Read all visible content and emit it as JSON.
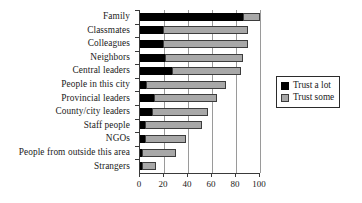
{
  "chart_data": {
    "type": "bar",
    "orientation": "horizontal",
    "stacked": true,
    "title": "",
    "xlabel": "",
    "ylabel": "",
    "xlim": [
      0,
      100
    ],
    "xticks": [
      0,
      20,
      40,
      60,
      80,
      100
    ],
    "grid": true,
    "grid_axis": "x",
    "legend_position": "right",
    "categories": [
      "Family",
      "Classmates",
      "Colleagues",
      "Neighbors",
      "Central leaders",
      "People in this city",
      "Provincial leaders",
      "County/city leaders",
      "Staff people",
      "NGOs",
      "People from outside this area",
      "Strangers"
    ],
    "series": [
      {
        "name": "Trust a lot",
        "color": "#000000",
        "values": [
          86,
          19,
          19,
          21,
          27,
          5,
          12,
          10,
          4,
          4,
          2,
          1
        ]
      },
      {
        "name": "Trust some",
        "color": "#a8a8a8",
        "values": [
          14,
          71,
          71,
          65,
          57,
          67,
          52,
          47,
          48,
          34,
          28,
          12
        ]
      }
    ],
    "totals": [
      100,
      90,
      90,
      86,
      84,
      72,
      64,
      57,
      52,
      38,
      30,
      13
    ]
  },
  "legend": {
    "items": [
      {
        "label": "Trust a lot",
        "swatch": "black-square-swatch"
      },
      {
        "label": "Trust some",
        "swatch": "gray-square-swatch"
      }
    ]
  },
  "axis": {
    "x_tick_labels": [
      "0",
      "20",
      "40",
      "60",
      "80",
      "100"
    ]
  }
}
